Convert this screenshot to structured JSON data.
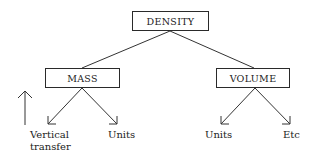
{
  "diagram": {
    "root": {
      "label": "DENSITY"
    },
    "children": [
      {
        "label": "MASS",
        "leaves": [
          {
            "label_line1": "Vertical",
            "label_line2": "transfer"
          },
          {
            "label": "Units"
          }
        ]
      },
      {
        "label": "VOLUME",
        "leaves": [
          {
            "label": "Units"
          },
          {
            "label": "Etc"
          }
        ]
      }
    ],
    "side_arrow": {
      "direction": "up",
      "icon": "arrow-up-icon"
    },
    "colors": {
      "line": "#333333",
      "text": "#222222",
      "background": "#ffffff"
    }
  }
}
